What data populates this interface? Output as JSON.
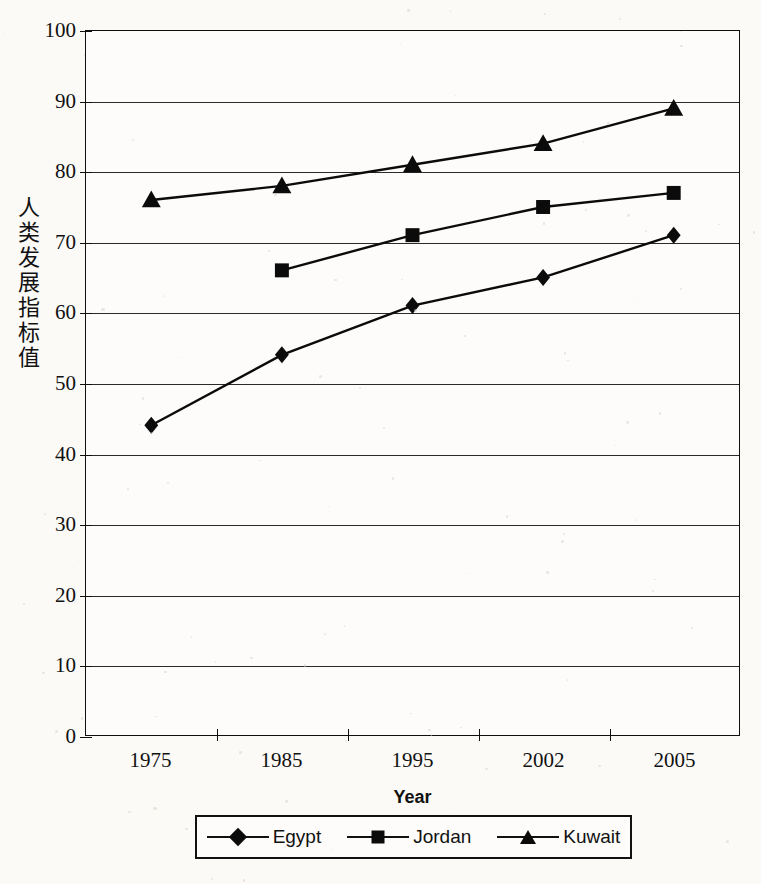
{
  "chart_data": {
    "type": "line",
    "title": "",
    "xlabel": "Year",
    "ylabel": "人类发展指标值",
    "categories": [
      "1975",
      "1985",
      "1995",
      "2002",
      "2005"
    ],
    "ylim": [
      0,
      100
    ],
    "yticks": [
      "0",
      "10",
      "20",
      "30",
      "40",
      "50",
      "60",
      "70",
      "80",
      "90",
      "100"
    ],
    "grid": true,
    "legend_position": "bottom",
    "series": [
      {
        "name": "Egypt",
        "marker": "diamond",
        "values": [
          44,
          54,
          61,
          65,
          71
        ]
      },
      {
        "name": "Jordan",
        "marker": "square",
        "values": [
          null,
          66,
          71,
          75,
          77
        ]
      },
      {
        "name": "Kuwait",
        "marker": "triangle",
        "values": [
          76,
          78,
          81,
          84,
          89
        ]
      }
    ]
  },
  "axis": {
    "y_label_chars": [
      "人",
      "类",
      "发",
      "展",
      "指",
      "标",
      "值"
    ],
    "x_title": "Year"
  },
  "legend": {
    "items": [
      {
        "label": "Egypt",
        "marker": "diamond-marker"
      },
      {
        "label": "Jordan",
        "marker": "square-marker"
      },
      {
        "label": "Kuwait",
        "marker": "triangle-marker"
      }
    ]
  },
  "colors": {
    "ink": "#0f0f0f",
    "paper": "#fbfaf7",
    "grid": "#2a2a2a"
  }
}
